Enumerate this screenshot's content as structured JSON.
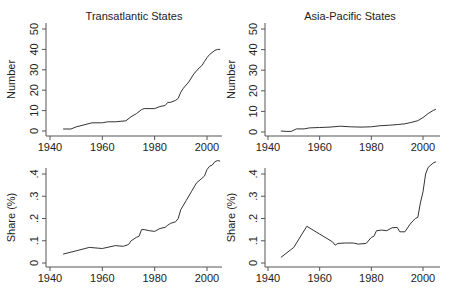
{
  "chart_data": [
    {
      "type": "line",
      "panel": "top-left",
      "title": "Transatlantic States",
      "ylabel": "Number",
      "xlabel": "",
      "xlim": [
        1938,
        2006
      ],
      "ylim": [
        -2,
        52
      ],
      "xticks": [
        1940,
        1960,
        1980,
        2000
      ],
      "yticks": [
        0,
        10,
        20,
        30,
        40,
        50
      ],
      "ytick_labels": [
        "0",
        "10",
        "20",
        "30",
        "40",
        "50"
      ],
      "x": [
        1945,
        1948,
        1950,
        1953,
        1956,
        1960,
        1962,
        1965,
        1969,
        1971,
        1973,
        1975,
        1976,
        1980,
        1982,
        1984,
        1985,
        1986,
        1988,
        1989,
        1990,
        1991,
        1993,
        1995,
        1997,
        1998,
        1999,
        2000,
        2001,
        2003,
        2004,
        2005
      ],
      "values": [
        1,
        1,
        2,
        3,
        4,
        4,
        4.5,
        4.5,
        5,
        7,
        8.5,
        10.5,
        11,
        11,
        12,
        12.5,
        14,
        14,
        15,
        16,
        19,
        21,
        24,
        28,
        31,
        32,
        34,
        36,
        37.5,
        39.5,
        40,
        40
      ]
    },
    {
      "type": "line",
      "panel": "top-right",
      "title": "Asia-Pacific States",
      "ylabel": "Number",
      "xlabel": "",
      "xlim": [
        1938,
        2006
      ],
      "ylim": [
        -2,
        52
      ],
      "xticks": [
        1940,
        1960,
        1980,
        2000
      ],
      "yticks": [
        0,
        10,
        20,
        30,
        40,
        50
      ],
      "ytick_labels": [
        "0",
        "10",
        "20",
        "30",
        "40",
        "50"
      ],
      "x": [
        1945,
        1947,
        1949,
        1951,
        1954,
        1956,
        1960,
        1964,
        1968,
        1972,
        1976,
        1980,
        1983,
        1987,
        1990,
        1993,
        1995,
        1998,
        2000,
        2002,
        2004,
        2005
      ],
      "values": [
        0.5,
        0.3,
        0.3,
        1.5,
        1.5,
        2,
        2.2,
        2.4,
        2.8,
        2.5,
        2.4,
        2.5,
        3,
        3.3,
        3.6,
        4,
        4.5,
        5.5,
        7,
        9,
        10.5,
        11
      ]
    },
    {
      "type": "line",
      "panel": "bottom-left",
      "title": "",
      "ylabel": "Share (%)",
      "xlabel": "",
      "xlim": [
        1938,
        2006
      ],
      "ylim": [
        -0.01,
        0.47
      ],
      "xticks": [
        1940,
        1960,
        1980,
        2000
      ],
      "yticks": [
        0,
        0.1,
        0.2,
        0.3,
        0.4
      ],
      "ytick_labels": [
        "0",
        ".1",
        ".2",
        ".3",
        ".4"
      ],
      "x": [
        1945,
        1950,
        1955,
        1960,
        1965,
        1968,
        1970,
        1971,
        1973,
        1974,
        1975,
        1976,
        1978,
        1980,
        1982,
        1984,
        1985,
        1986,
        1988,
        1989,
        1990,
        1992,
        1994,
        1996,
        1998,
        1999,
        2000,
        2001,
        2002,
        2003,
        2004,
        2005
      ],
      "values": [
        0.04,
        0.055,
        0.07,
        0.065,
        0.078,
        0.075,
        0.083,
        0.1,
        0.115,
        0.12,
        0.15,
        0.15,
        0.145,
        0.142,
        0.155,
        0.16,
        0.17,
        0.178,
        0.185,
        0.2,
        0.24,
        0.28,
        0.32,
        0.36,
        0.38,
        0.39,
        0.42,
        0.435,
        0.44,
        0.455,
        0.46,
        0.458
      ]
    },
    {
      "type": "line",
      "panel": "bottom-right",
      "title": "",
      "ylabel": "Share (%)",
      "xlabel": "",
      "xlim": [
        1938,
        2006
      ],
      "ylim": [
        -0.01,
        0.47
      ],
      "xticks": [
        1940,
        1960,
        1980,
        2000
      ],
      "yticks": [
        0,
        0.1,
        0.2,
        0.3,
        0.4
      ],
      "ytick_labels": [
        "0",
        ".1",
        ".2",
        ".3",
        ".4"
      ],
      "x": [
        1945,
        1950,
        1955,
        1960,
        1965,
        1966,
        1967,
        1970,
        1973,
        1975,
        1978,
        1980,
        1981,
        1982,
        1984,
        1986,
        1988,
        1990,
        1991,
        1993,
        1995,
        1997,
        1998,
        1999,
        2000,
        2001,
        2002,
        2003,
        2004,
        2005
      ],
      "values": [
        0.025,
        0.07,
        0.165,
        0.13,
        0.095,
        0.08,
        0.088,
        0.09,
        0.09,
        0.085,
        0.088,
        0.115,
        0.12,
        0.145,
        0.148,
        0.145,
        0.158,
        0.16,
        0.14,
        0.14,
        0.175,
        0.2,
        0.205,
        0.27,
        0.32,
        0.4,
        0.43,
        0.44,
        0.45,
        0.455
      ]
    }
  ]
}
